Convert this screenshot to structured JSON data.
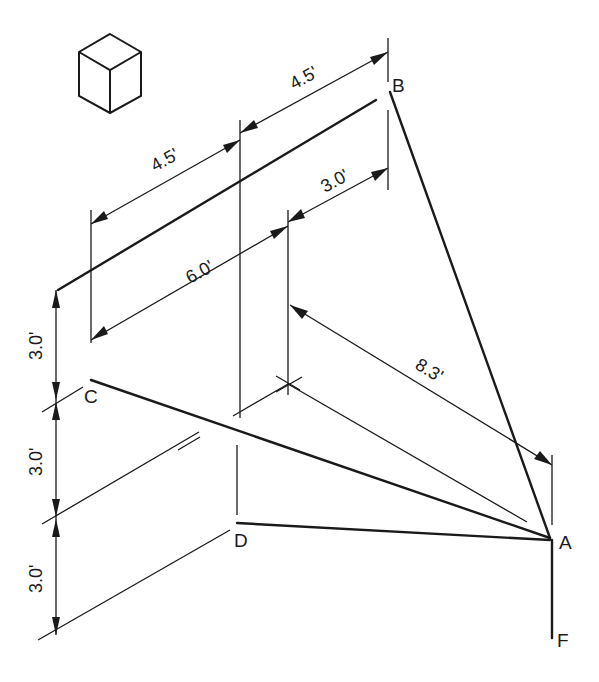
{
  "diagram": {
    "type": "isometric-pictorial-dimension-drawing",
    "view_icon": "isometric-cube-icon",
    "points": {
      "A": {
        "label": "A"
      },
      "B": {
        "label": "B"
      },
      "C": {
        "label": "C"
      },
      "D": {
        "label": "D"
      },
      "F": {
        "label": "F"
      }
    },
    "dimensions": {
      "top_right_4_5": "4.5'",
      "top_left_4_5": "4.5'",
      "mid_3_0": "3.0'",
      "mid_6_0": "6.0'",
      "diag_8_3": "8.3'",
      "vert_top_3_0": "3.0'",
      "vert_mid_3_0": "3.0'",
      "vert_bot_3_0": "3.0'"
    },
    "lines": [
      {
        "from": "B",
        "to": "A",
        "style": "thick"
      },
      {
        "from": "C",
        "to": "A",
        "style": "thick"
      },
      {
        "from": "D",
        "to": "A",
        "style": "thick"
      },
      {
        "from": "A",
        "to": "F",
        "style": "thick"
      }
    ]
  }
}
